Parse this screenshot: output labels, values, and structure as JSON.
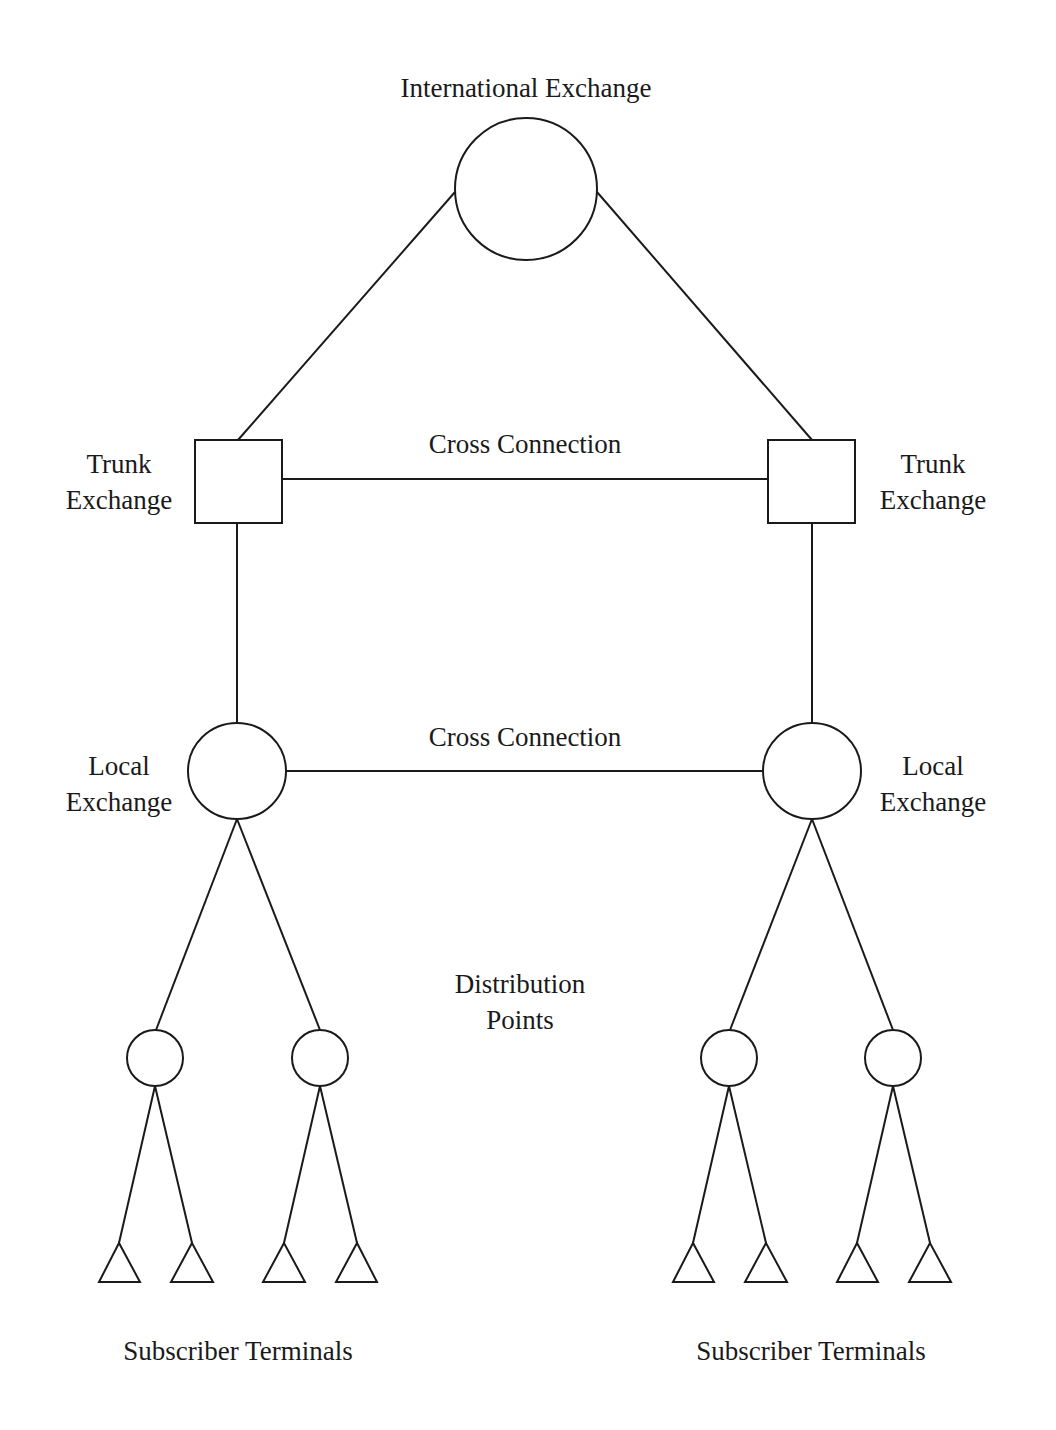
{
  "title": "International Exchange",
  "labels": {
    "international_exchange": "International Exchange",
    "cross_connection_upper": "Cross Connection",
    "cross_connection_lower": "Cross Connection",
    "trunk_left": [
      "Trunk",
      "Exchange"
    ],
    "trunk_right": [
      "Trunk",
      "Exchange"
    ],
    "local_left": [
      "Local",
      "Exchange"
    ],
    "local_right": [
      "Local",
      "Exchange"
    ],
    "distribution": [
      "Distribution",
      "Points"
    ],
    "subscribers_left": "Subscriber Terminals",
    "subscribers_right": "Subscriber Terminals"
  },
  "nodes": {
    "international_exchange": {
      "shape": "circle"
    },
    "trunk_exchanges": [
      {
        "shape": "square",
        "side": "left"
      },
      {
        "shape": "square",
        "side": "right"
      }
    ],
    "local_exchanges": [
      {
        "shape": "circle",
        "side": "left"
      },
      {
        "shape": "circle",
        "side": "right"
      }
    ],
    "distribution_points": 4,
    "subscriber_terminals": 8
  },
  "colors": {
    "stroke": "#1a1a1a",
    "background": "#ffffff"
  }
}
